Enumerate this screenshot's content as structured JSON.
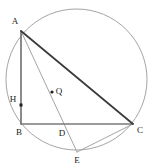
{
  "figure": {
    "width": 150,
    "height": 167,
    "background_color": "#ffffff"
  },
  "circle": {
    "name": "circumscribed-circle",
    "center_x": 76.5,
    "center_y": 79.5,
    "radius": 70.5,
    "stroke_color": "#8d8d8d",
    "stroke_width": 0.8
  },
  "points": [
    {
      "id": "A",
      "label": "A",
      "x": 21,
      "y": 31,
      "label_x": 15,
      "label_y": 22,
      "marker": "none"
    },
    {
      "id": "B",
      "label": "B",
      "x": 21,
      "y": 124,
      "label_x": 19,
      "label_y": 133,
      "marker": "none"
    },
    {
      "id": "C",
      "label": "C",
      "x": 133,
      "y": 124,
      "label_x": 140,
      "label_y": 131,
      "marker": "none"
    },
    {
      "id": "D",
      "label": "D",
      "x": 62,
      "y": 124,
      "label_x": 62,
      "label_y": 134,
      "marker": "none"
    },
    {
      "id": "E",
      "label": "E",
      "x": 77,
      "y": 152,
      "label_x": 77,
      "label_y": 161,
      "marker": "none"
    },
    {
      "id": "H",
      "label": "H",
      "x": 21,
      "y": 105,
      "label_x": 13,
      "label_y": 100,
      "marker": "square"
    },
    {
      "id": "Q",
      "label": "Q",
      "x": 52,
      "y": 92,
      "label_x": 59,
      "label_y": 92,
      "marker": "dot"
    }
  ],
  "segments": [
    {
      "name": "segment-AB",
      "from": "A",
      "to": "B",
      "stroke_color": "#6e6e6e",
      "stroke_width": 1.6
    },
    {
      "name": "segment-BC",
      "from": "B",
      "to": "C",
      "stroke_color": "#7a7a7a",
      "stroke_width": 1.5
    },
    {
      "name": "segment-AC",
      "from": "A",
      "to": "C",
      "stroke_color": "#3a3a3a",
      "stroke_width": 1.7
    },
    {
      "name": "segment-AE",
      "from": "A",
      "to": "E",
      "stroke_color": "#9a9a9a",
      "stroke_width": 0.9
    },
    {
      "name": "segment-EC",
      "from": "E",
      "to": "C",
      "stroke_color": "#9a9a9a",
      "stroke_width": 0.9
    }
  ],
  "markers": {
    "square_size": 3,
    "square_color": "#1f1f1f",
    "dot_radius": 1.6,
    "dot_color": "#1f1f1f"
  }
}
